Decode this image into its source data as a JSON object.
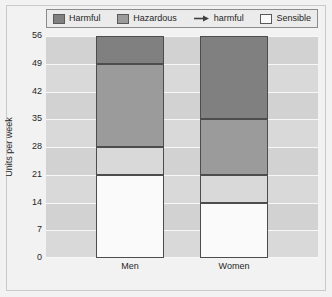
{
  "chart_data": {
    "type": "bar",
    "subtype": "stacked",
    "title": "",
    "xlabel": "",
    "ylabel": "Units per week",
    "categories": [
      "Men",
      "Women"
    ],
    "ylim": [
      0,
      56
    ],
    "yticks": [
      0,
      7,
      14,
      21,
      28,
      35,
      42,
      49,
      56
    ],
    "grid": true,
    "legend_position": "top",
    "series": [
      {
        "name": "Harmful",
        "marker": "swatch",
        "color": "#808080",
        "values": [
          7,
          21
        ],
        "segment_ranges": [
          [
            49,
            56
          ],
          [
            35,
            56
          ]
        ]
      },
      {
        "name": "Hazardous",
        "marker": "swatch",
        "color": "#9b9b9b",
        "values": [
          21,
          14
        ],
        "segment_ranges": [
          [
            28,
            49
          ],
          [
            21,
            35
          ]
        ]
      },
      {
        "name": "harmful",
        "marker": "arrow",
        "color": "#d9d9d9",
        "values": [
          7,
          7
        ],
        "segment_ranges": [
          [
            21,
            28
          ],
          [
            14,
            21
          ]
        ]
      },
      {
        "name": "Sensible",
        "marker": "swatch",
        "color": "#fafafa",
        "values": [
          21,
          14
        ],
        "segment_ranges": [
          [
            0,
            21
          ],
          [
            0,
            14
          ]
        ]
      }
    ],
    "totals": [
      56,
      56
    ],
    "background_color": "#d9d9d9",
    "gridline_color": "#f7f7f7",
    "figure_color": "#f2f2f2"
  },
  "legend": {
    "items": [
      {
        "label": "Harmful",
        "marker": "swatch",
        "color": "#808080"
      },
      {
        "label": "Hazardous",
        "marker": "swatch",
        "color": "#9b9b9b"
      },
      {
        "label": "harmful",
        "marker": "arrow",
        "color": "#404040"
      },
      {
        "label": "Sensible",
        "marker": "swatch",
        "color": "#fafafa"
      }
    ]
  },
  "axes": {
    "y_label": "Units per week",
    "y_ticks": [
      "56",
      "49",
      "42",
      "35",
      "28",
      "21",
      "14",
      "7",
      "0"
    ],
    "x_ticks": [
      "Men",
      "Women"
    ]
  }
}
